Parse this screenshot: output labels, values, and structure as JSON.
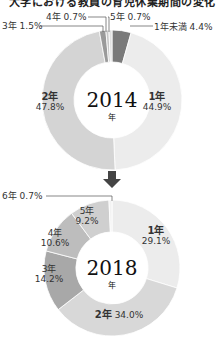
{
  "title": "大学における教員の育児休業期間の変化",
  "chart_data": [
    {
      "type": "pie",
      "title": "2014年",
      "center_label": "2014",
      "center_sub": "年",
      "categories": [
        "1年未満",
        "1年",
        "2年",
        "3年",
        "4年",
        "5年"
      ],
      "values": [
        4.4,
        44.9,
        47.8,
        1.5,
        0.7,
        0.7
      ],
      "colors": [
        "#7a7a7a",
        "#ececec",
        "#d4d4d4",
        "#9a9a9a",
        "#c8c8c8",
        "#e0e0e0"
      ]
    },
    {
      "type": "pie",
      "title": "2018年",
      "center_label": "2018",
      "center_sub": "年",
      "categories": [
        "1年",
        "2年",
        "3年",
        "4年",
        "5年",
        "6年"
      ],
      "values": [
        29.1,
        34.0,
        14.2,
        10.6,
        9.2,
        0.7
      ],
      "colors": [
        "#ececec",
        "#d8d8d8",
        "#a8a8a8",
        "#bdbdbd",
        "#cfcfcf",
        "#f2f2f2"
      ]
    }
  ],
  "labels": {
    "top": {
      "y3": "3年 1.5%",
      "y4": "4年 0.7%",
      "y5": "5年 0.7%",
      "under1": "1年未満 4.4%",
      "y1_name": "1年",
      "y1_pct": "44.9%",
      "y2_name": "2年",
      "y2_pct": "47.8%"
    },
    "bottom": {
      "y6": "6年 0.7%",
      "y1_name": "1年",
      "y1_pct": "29.1%",
      "y2_name": "2年",
      "y2_pct": "34.0%",
      "y3_name": "3年",
      "y3_pct": "14.2%",
      "y4_name": "4年",
      "y4_pct": "10.6%",
      "y5_name": "5年",
      "y5_pct": "9.2%"
    }
  },
  "arrow": "down-arrow"
}
